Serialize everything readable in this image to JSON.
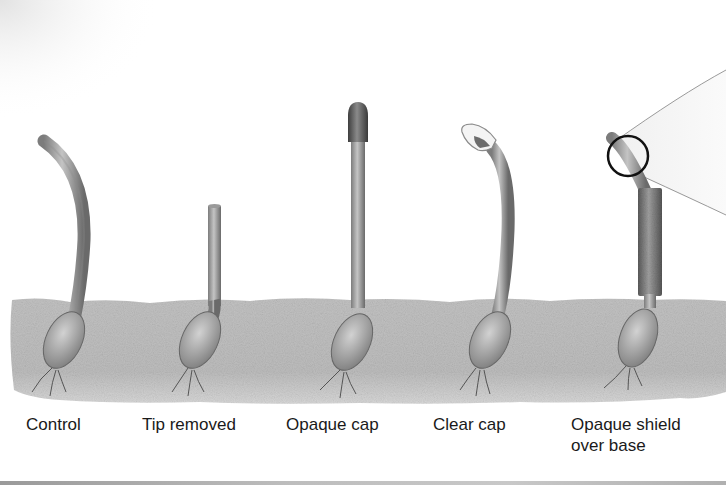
{
  "figure": {
    "topic": "Coleoptile phototropism experiment",
    "light_source": {
      "icon": "light-beam-icon",
      "direction": "from right",
      "highlight_circle_color": "#111111"
    },
    "colors": {
      "soil": "#b9b9b9",
      "stem": "#a8a8a8",
      "stem_dark": "#6e6e6e",
      "opaque_cap": "#5a5a5a",
      "clear_cap": "#f2f2f2",
      "shield": "#7a7a7a",
      "label_text": "#1a1a1a"
    },
    "seedlings": [
      {
        "id": "control",
        "label": "Control",
        "state": "bends toward light"
      },
      {
        "id": "tip-removed",
        "label": "Tip removed",
        "state": "straight, short"
      },
      {
        "id": "opaque-cap",
        "label": "Opaque cap",
        "state": "straight"
      },
      {
        "id": "clear-cap",
        "label": "Clear cap",
        "state": "bends toward light"
      },
      {
        "id": "opaque-shield",
        "label_line1": "Opaque shield",
        "label_line2": "over base",
        "state": "tip bends toward light"
      }
    ]
  }
}
